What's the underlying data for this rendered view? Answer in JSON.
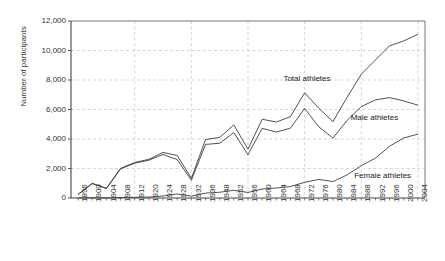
{
  "chart_data": {
    "type": "line",
    "title": "",
    "xlabel": "",
    "ylabel": "Number of participants",
    "ylim": [
      0,
      12000
    ],
    "ytick_step": 2000,
    "grid": true,
    "legend_position": "inline-annotations",
    "categories": [
      "1896",
      "1900",
      "1904",
      "1908",
      "1912",
      "1920",
      "1924",
      "1928",
      "1932",
      "1936",
      "1948",
      "1952",
      "1956",
      "1960",
      "1964",
      "1968",
      "1972",
      "1976",
      "1980",
      "1984",
      "1988",
      "1992",
      "1996",
      "2000",
      "2004"
    ],
    "ytick_labels": [
      "0",
      "2,000",
      "4,000",
      "6,000",
      "8,000",
      "10,000",
      "12,000"
    ],
    "ytick_values": [
      0,
      2000,
      4000,
      6000,
      8000,
      10000,
      12000
    ],
    "series": [
      {
        "name": "Total athletes",
        "values": [
          241,
          997,
          651,
          2008,
          2407,
          2626,
          3089,
          2883,
          1332,
          3963,
          4104,
          4955,
          3314,
          5338,
          5151,
          5516,
          7134,
          6084,
          5179,
          6829,
          8391,
          9356,
          10318,
          10651,
          11099
        ]
      },
      {
        "name": "Male athletes",
        "values": [
          241,
          975,
          645,
          1971,
          2359,
          2561,
          2954,
          2606,
          1206,
          3632,
          3714,
          4436,
          2938,
          4727,
          4473,
          4735,
          6075,
          4824,
          4064,
          5263,
          6197,
          6652,
          6806,
          6582,
          6296
        ]
      },
      {
        "name": "Female athletes",
        "values": [
          0,
          22,
          6,
          37,
          48,
          65,
          135,
          277,
          126,
          331,
          390,
          519,
          376,
          611,
          678,
          781,
          1059,
          1260,
          1115,
          1566,
          2194,
          2704,
          3512,
          4069,
          4329
        ]
      }
    ],
    "annotations": [
      {
        "text": "Total athletes",
        "x": 0.6,
        "y": 8050
      },
      {
        "text": "Male athletes",
        "x": 0.79,
        "y": 5450
      },
      {
        "text": "Female athletes",
        "x": 0.8,
        "y": 1520
      }
    ]
  },
  "axis_label_y": "Number of participants"
}
